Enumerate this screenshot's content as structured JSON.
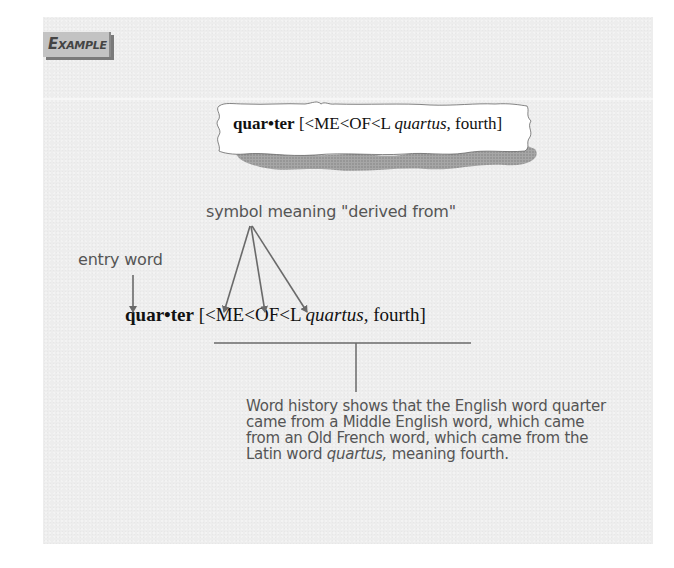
{
  "tab": {
    "label": "Example"
  },
  "card": {
    "headword": "quar•ter",
    "etymology_prefix": "[<ME<OF<L",
    "etymology_latin": "quartus,",
    "etymology_suffix": "fourth]"
  },
  "annotations": {
    "symbol_label": "symbol meaning \"derived from\"",
    "entry_label": "entry word"
  },
  "entry": {
    "headword": "quar•ter",
    "etymology_prefix": "[<ME<OF<L",
    "etymology_latin": "quartus,",
    "etymology_suffix": "fourth]"
  },
  "explanation": {
    "line1": "Word history shows that the English word quarter",
    "line2": "came from a Middle English word, which came",
    "line3": "from an Old French word, which came from the",
    "line4_pre": "Latin word ",
    "line4_italic": "quartus,",
    "line4_post": " meaning fourth."
  },
  "colors": {
    "panel_bg": "#ededed",
    "tab_bg": "#c3c3c3",
    "annotation_text": "#555555",
    "arrow": "#6a6a6a",
    "entry_text": "#111111"
  }
}
